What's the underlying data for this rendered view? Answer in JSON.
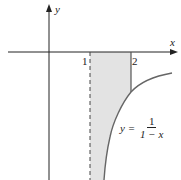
{
  "diagram": {
    "axes": {
      "x_label": "x",
      "y_label": "y"
    },
    "ticks": [
      {
        "label": "1"
      },
      {
        "label": "2"
      }
    ],
    "curve": {
      "lhs": "y =",
      "numerator": "1",
      "denominator": "1 − x"
    },
    "region": {
      "fill": "#e3e3e3",
      "description": "shaded region between x=1 asymptote and x=2, above curve and below x-axis"
    },
    "colors": {
      "axis": "#222222",
      "curve": "#666666",
      "shade": "#e3e3e3"
    }
  }
}
